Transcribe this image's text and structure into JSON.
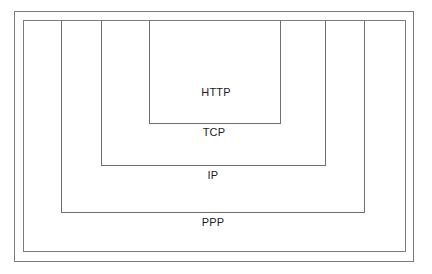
{
  "diagram": {
    "title": "",
    "type": "nested protocol layers",
    "layers": [
      {
        "id": "http",
        "label": "HTTP"
      },
      {
        "id": "tcp",
        "label": "TCP"
      },
      {
        "id": "ip",
        "label": "IP"
      },
      {
        "id": "ppp",
        "label": "PPP"
      }
    ]
  }
}
